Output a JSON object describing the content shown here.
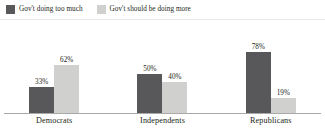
{
  "legend": {
    "items": [
      {
        "label": "Gov't doing too much",
        "color": "#58585a",
        "icon": "square-swatch-icon"
      },
      {
        "label": "Gov't should be doing more",
        "color": "#d0d0ce",
        "icon": "square-swatch-icon"
      }
    ]
  },
  "chart_data": {
    "type": "bar",
    "title": "",
    "subtitle": "",
    "xlabel": "",
    "ylabel": "",
    "ylim": [
      0,
      100
    ],
    "grid": false,
    "legend_position": "top-left",
    "categories": [
      "Democrats",
      "Independents",
      "Republicans"
    ],
    "series": [
      {
        "name": "Gov't doing too much",
        "color": "#58585a",
        "values": [
          33,
          50,
          78
        ],
        "labels": [
          "33%",
          "50%",
          "78%"
        ]
      },
      {
        "name": "Gov't should be doing more",
        "color": "#d0d0ce",
        "values": [
          62,
          40,
          19
        ],
        "labels": [
          "62%",
          "40%",
          "19%"
        ]
      }
    ]
  },
  "axis": {
    "baseline_color": "#a9a9a9"
  }
}
